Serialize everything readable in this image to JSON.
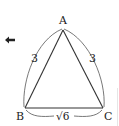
{
  "diagram": {
    "type": "triangle",
    "vertices": {
      "A": {
        "label": "A",
        "x": 63,
        "y": 30
      },
      "B": {
        "label": "B",
        "x": 25,
        "y": 108
      },
      "C": {
        "label": "C",
        "x": 103,
        "y": 108
      }
    },
    "sides": {
      "AB": {
        "label": "3"
      },
      "AC": {
        "label": "3"
      },
      "BC": {
        "label": "√6"
      }
    },
    "arrow_icon": "left-arrow-icon",
    "colors": {
      "stroke": "#333333",
      "text": "#222222"
    }
  }
}
